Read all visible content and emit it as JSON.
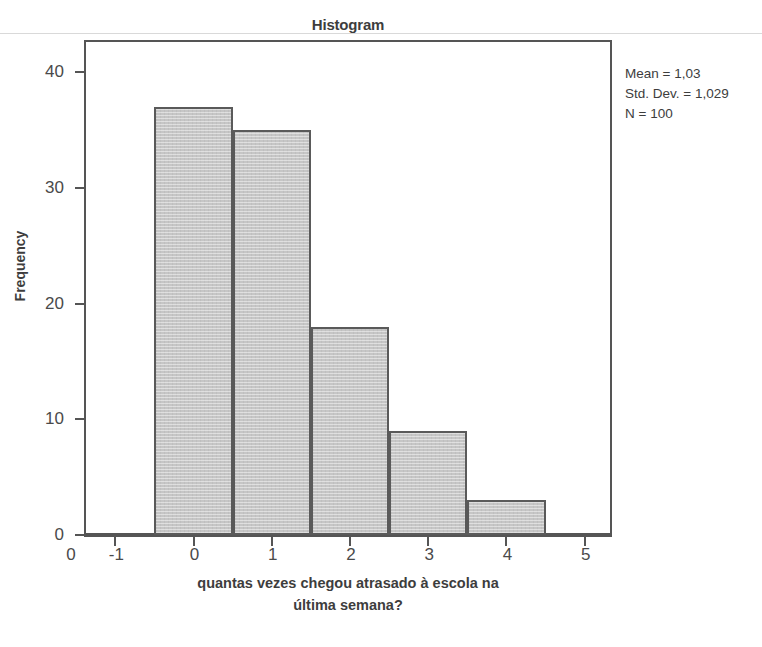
{
  "chart_data": {
    "type": "bar",
    "title": "Histogram",
    "xlabel": "quantas vezes chegou atrasado à escola na última semana?",
    "xlabel_line1": "quantas vezes chegou atrasado à escola na",
    "xlabel_line2": "última semana?",
    "ylabel": "Frequency",
    "categories": [
      "0",
      "1",
      "2",
      "3",
      "4"
    ],
    "values": [
      37,
      35,
      18,
      9,
      3
    ],
    "bin_edges": [
      -0.5,
      0.5,
      1.5,
      2.5,
      3.5,
      4.5
    ],
    "x_ticks": [
      "-1",
      "0",
      "1",
      "2",
      "3",
      "4",
      "5"
    ],
    "x_tick_values": [
      -1,
      0,
      1,
      2,
      3,
      4,
      5
    ],
    "y_ticks": [
      "0",
      "10",
      "20",
      "30",
      "40"
    ],
    "y_tick_values": [
      0,
      10,
      20,
      30,
      40
    ],
    "xlim": [
      -1.4,
      5.35
    ],
    "ylim": [
      0,
      42.8
    ],
    "grid": false,
    "legend": false,
    "bar_fill_color": "#c6c6c6",
    "bar_border_color": "#5a5a5a",
    "axis_color": "#555555",
    "text_color": "#3d3d3d"
  },
  "annotations": {
    "stats": [
      "Mean = 1,03",
      "Std. Dev. = 1,029",
      "N = 100"
    ]
  }
}
